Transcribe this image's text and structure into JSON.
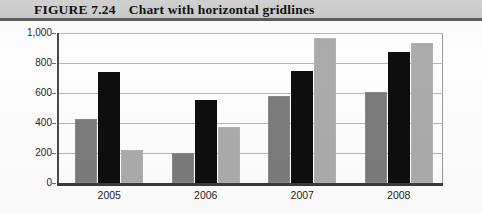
{
  "figure": {
    "caption_number": "FIGURE 7.24",
    "caption_title": "Chart with horizontal gridlines"
  },
  "chart_data": {
    "type": "bar",
    "title": "Chart with horizontal gridlines",
    "xlabel": "",
    "ylabel": "",
    "categories": [
      "2005",
      "2006",
      "2007",
      "2008"
    ],
    "series": [
      {
        "name": "Series 1",
        "color": "#7b7b7b",
        "values": [
          425,
          200,
          580,
          605
        ]
      },
      {
        "name": "Series 2",
        "color": "#0e0e0e",
        "values": [
          740,
          555,
          745,
          875
        ]
      },
      {
        "name": "Series 3",
        "color": "#ababab",
        "values": [
          220,
          375,
          970,
          935
        ]
      }
    ],
    "ylim": [
      0,
      1000
    ],
    "yticks": [
      0,
      200,
      400,
      600,
      800,
      1000
    ],
    "ytick_labels": [
      "0",
      "200",
      "400",
      "600",
      "800",
      "1,000"
    ],
    "grid": "horizontal",
    "legend": "none"
  },
  "colors": {
    "caption_band": "#cfcfcf",
    "caption_rule": "#5d5d5d",
    "gridline": "#b6b6b6",
    "axis": "#3a3a3a",
    "page_background": "#fdfdfd"
  }
}
